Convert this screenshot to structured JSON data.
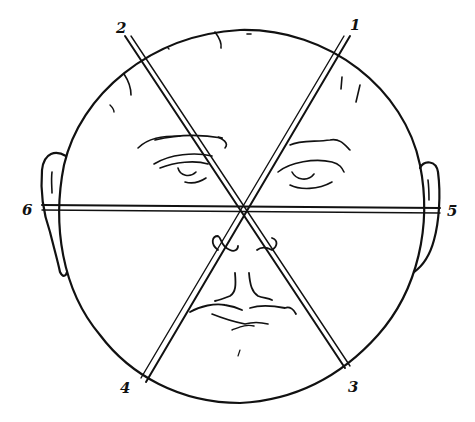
{
  "figure": {
    "type": "line-drawing",
    "ink_color": "#111111",
    "background": "#ffffff",
    "axes": [
      {
        "id": "axis-1-4",
        "labels": [
          "1",
          "4"
        ]
      },
      {
        "id": "axis-2-3",
        "labels": [
          "2",
          "3"
        ]
      },
      {
        "id": "axis-6-5",
        "labels": [
          "6",
          "5"
        ]
      }
    ],
    "labels": {
      "l1": "1",
      "l2": "2",
      "l3": "3",
      "l4": "4",
      "l5": "5",
      "l6": "6"
    }
  }
}
